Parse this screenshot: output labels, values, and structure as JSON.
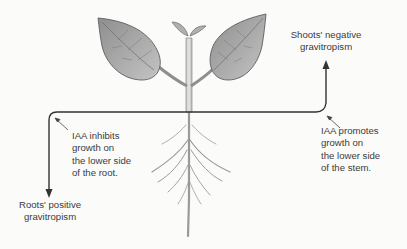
{
  "diagram": {
    "labels": {
      "shoots": {
        "lines": [
          "Shoots' negative",
          "gravitropism"
        ]
      },
      "roots": {
        "lines": [
          "Roots' positive",
          "gravitropism"
        ]
      },
      "iaa_root": {
        "lines": [
          "IAA inhibits",
          "growth on",
          "the lower side",
          "of the root."
        ]
      },
      "iaa_stem": {
        "lines": [
          "IAA promotes",
          "growth on",
          "the lower side",
          "of the stem."
        ]
      }
    },
    "elements": {
      "ground_line": "horizontal soil line",
      "shoot_arrow": "arrow-up",
      "root_arrow": "arrow-down",
      "plant": "seedling with two leaves, bud, stem and branching roots"
    },
    "colors": {
      "background": "#fbfbfa",
      "line": "#3a3a3a",
      "plant_fill": "#a9a9a9",
      "plant_stroke": "#6b6b6b"
    }
  }
}
